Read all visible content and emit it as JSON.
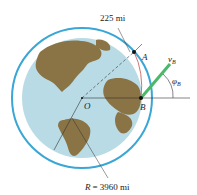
{
  "labels": {
    "altitude": "225 mi",
    "point_a": "A",
    "point_b": "B",
    "center": "O",
    "velocity": "v",
    "velocity_sub": "B",
    "angle": "φ",
    "angle_sub": "B",
    "radius_var": "R",
    "radius_value": "= 3960 mi"
  },
  "colors": {
    "orbit": "#3aa6d6",
    "ocean": "#b9dbe6",
    "land": "#8a7344",
    "velocity": "#4cb86a",
    "trajectory": "#c0504d"
  }
}
